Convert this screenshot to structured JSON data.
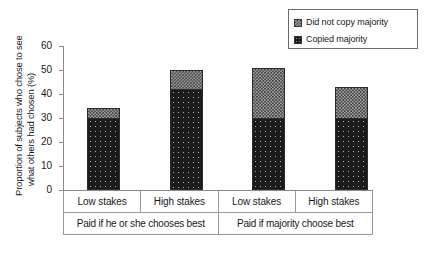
{
  "chart_data": {
    "type": "bar",
    "subtype": "stacked-bar",
    "title": "",
    "xlabel": "",
    "ylabel": "Proportion of subjects who chose to see what others had chosen (%)",
    "ylabel_lines": [
      "Proportion of subjects who chose to see",
      "what others had chosen (%)"
    ],
    "ylim": [
      0,
      60
    ],
    "yticks": [
      0,
      10,
      20,
      30,
      40,
      50,
      60
    ],
    "ytick_labels": [
      "0",
      "10",
      "20",
      "30",
      "40",
      "50",
      "60"
    ],
    "grid": false,
    "legend_position": "top-right",
    "categories": [
      "Low stakes",
      "High stakes",
      "Low stakes",
      "High stakes"
    ],
    "group_labels": [
      "Paid if he or she chooses best",
      "Paid if majority choose best"
    ],
    "series": [
      {
        "name": "Copied majority",
        "values": [
          30,
          42,
          30,
          30
        ],
        "color": "#1b1b1b",
        "pattern": "dark-dotted"
      },
      {
        "name": "Did not copy majority",
        "values": [
          4,
          8,
          21,
          13
        ],
        "color": "#9d9d9d",
        "pattern": "gray-checkered"
      }
    ],
    "totals": [
      34,
      50,
      51,
      43
    ]
  },
  "legend": {
    "items": [
      {
        "label": "Did not copy majority",
        "swatch": "gray-checkered-swatch"
      },
      {
        "label": "Copied majority",
        "swatch": "dark-dotted-swatch"
      }
    ]
  },
  "axis": {
    "y_title_line_1": "Proportion of subjects who chose to see",
    "y_title_line_2": "what others had chosen (%)",
    "ticks": [
      "60",
      "50",
      "40",
      "30",
      "20",
      "10",
      "0"
    ]
  },
  "categories_table": {
    "row_stakes": [
      "Low stakes",
      "High stakes",
      "Low stakes",
      "High stakes"
    ],
    "row_groups": [
      "Paid if he or she chooses best",
      "Paid if majority choose best"
    ]
  }
}
